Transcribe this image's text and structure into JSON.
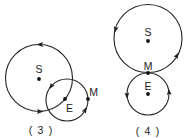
{
  "colors": {
    "stroke": "#222222",
    "dot": "#111111",
    "background": "#ffffff"
  },
  "figures": [
    {
      "caption": "( 3 )",
      "labels": {
        "sun": "S",
        "earth": "E",
        "moon": "M"
      },
      "orbits": [
        {
          "name": "large-orbit",
          "center": "S",
          "direction": "counterclockwise",
          "arrows": 2
        },
        {
          "name": "small-orbit",
          "center": "E",
          "passes_through": "M",
          "direction": "counterclockwise",
          "arrows": 2
        }
      ]
    },
    {
      "caption": "( 4 )",
      "labels": {
        "sun": "S",
        "moon": "M",
        "earth": "E"
      },
      "orbits": [
        {
          "name": "large-orbit",
          "center": "S",
          "passes_through": "M",
          "direction": "counterclockwise",
          "arrows": 2
        },
        {
          "name": "small-orbit",
          "center": "E",
          "passes_through": "M",
          "direction": "counterclockwise",
          "arrows": 2
        }
      ]
    }
  ]
}
